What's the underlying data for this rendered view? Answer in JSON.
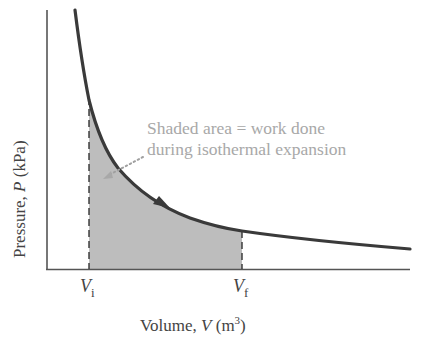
{
  "diagram": {
    "y_axis": {
      "label_prefix": "Pressure, ",
      "label_var": "P",
      "label_unit": " (kPa)"
    },
    "x_axis": {
      "label_prefix": "Volume, ",
      "label_var": "V",
      "label_unit_open": " (m",
      "label_unit_sup": "3",
      "label_unit_close": ")"
    },
    "ticks": [
      {
        "var": "V",
        "sub": "i"
      },
      {
        "var": "V",
        "sub": "f"
      }
    ],
    "annotation": {
      "line1": "Shaded area = work done",
      "line2": "during isothermal expansion"
    },
    "colors": {
      "curve": "#3a3a3a",
      "shade": "#b8b8b8",
      "axis": "#555555",
      "annotation": "#a8a8a8"
    }
  }
}
